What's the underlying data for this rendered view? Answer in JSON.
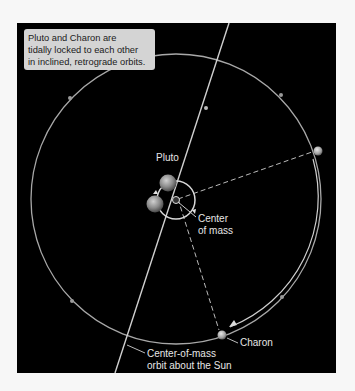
{
  "caption": {
    "lines": [
      "Pluto and Charon are",
      "tidally locked to each other",
      "in inclined, retrograde orbits."
    ]
  },
  "labels": {
    "pluto": "Pluto",
    "center_of_mass": [
      "Center",
      "of mass"
    ],
    "charon": "Charon",
    "orbit_sun": [
      "Center-of-mass",
      "orbit about the Sun"
    ]
  },
  "colors": {
    "background": "#000000",
    "orbit_line": "#bdbdbd",
    "caption_bg": "#d4d4d4",
    "body_fill": "#8a8a8a"
  }
}
